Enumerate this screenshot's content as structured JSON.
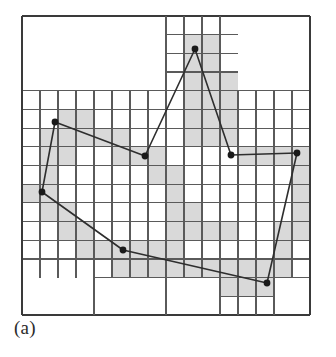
{
  "figure": {
    "caption": "(a)",
    "kind": "quadtree-polygon-decomposition"
  },
  "colors": {
    "background": "#ffffff",
    "grid_line": "#5a5a5a",
    "border_line": "#3a3a3a",
    "shaded_cell": "#d9d9d9",
    "polygon_line": "#2e2e2e",
    "vertex_fill": "#1a1a1a",
    "caption_text": "#2b2b2b"
  },
  "chart_data": {
    "type": "diagram",
    "xlabel": "",
    "ylabel": "",
    "grid": true,
    "legend": "none",
    "canvas": {
      "width": 336,
      "height": 357
    },
    "plot_area": {
      "x": 22,
      "y": 16,
      "width": 288,
      "height": 299
    },
    "base_grid": {
      "cols": 16,
      "rows": 16,
      "cell_width": 18.0,
      "cell_height": 18.6875
    },
    "polygon": {
      "closed": true,
      "vertex_count": 8,
      "vertices": [
        {
          "id": "v1",
          "x": 195,
          "y": 49
        },
        {
          "id": "v2",
          "x": 231,
          "y": 155
        },
        {
          "id": "v3",
          "x": 297,
          "y": 153
        },
        {
          "id": "v4",
          "x": 267,
          "y": 283
        },
        {
          "id": "v5",
          "x": 123,
          "y": 250
        },
        {
          "id": "v6",
          "x": 42,
          "y": 192
        },
        {
          "id": "v7",
          "x": 55,
          "y": 122
        },
        {
          "id": "v8",
          "x": 145,
          "y": 156
        }
      ],
      "edges": [
        {
          "from": "v1",
          "to": "v2"
        },
        {
          "from": "v2",
          "to": "v3"
        },
        {
          "from": "v3",
          "to": "v4"
        },
        {
          "from": "v4",
          "to": "v5"
        },
        {
          "from": "v5",
          "to": "v6"
        },
        {
          "from": "v6",
          "to": "v7"
        },
        {
          "from": "v7",
          "to": "v8"
        },
        {
          "from": "v8",
          "to": "v1"
        }
      ]
    },
    "shaded_cells": [
      {
        "c": 9,
        "r": 1,
        "w": 1,
        "h": 1
      },
      {
        "c": 10,
        "r": 1,
        "w": 1,
        "h": 1
      },
      {
        "c": 9,
        "r": 2,
        "w": 1,
        "h": 1
      },
      {
        "c": 10,
        "r": 2,
        "w": 1,
        "h": 1
      },
      {
        "c": 9,
        "r": 3,
        "w": 1,
        "h": 1
      },
      {
        "c": 10,
        "r": 3,
        "w": 1,
        "h": 1
      },
      {
        "c": 11,
        "r": 3,
        "w": 1,
        "h": 1
      },
      {
        "c": 2,
        "r": 5,
        "w": 1,
        "h": 1
      },
      {
        "c": 3,
        "r": 5,
        "w": 1,
        "h": 1
      },
      {
        "c": 9,
        "r": 4,
        "w": 1,
        "h": 1
      },
      {
        "c": 10,
        "r": 4,
        "w": 1,
        "h": 1
      },
      {
        "c": 11,
        "r": 4,
        "w": 1,
        "h": 1
      },
      {
        "c": 1,
        "r": 6,
        "w": 1,
        "h": 1
      },
      {
        "c": 2,
        "r": 6,
        "w": 1,
        "h": 1
      },
      {
        "c": 3,
        "r": 6,
        "w": 1,
        "h": 1
      },
      {
        "c": 4,
        "r": 6,
        "w": 1,
        "h": 1
      },
      {
        "c": 5,
        "r": 6,
        "w": 1,
        "h": 1
      },
      {
        "c": 9,
        "r": 5,
        "w": 1,
        "h": 1
      },
      {
        "c": 10,
        "r": 5,
        "w": 1,
        "h": 1
      },
      {
        "c": 11,
        "r": 5,
        "w": 1,
        "h": 1
      },
      {
        "c": 1,
        "r": 7,
        "w": 1,
        "h": 1
      },
      {
        "c": 2,
        "r": 7,
        "w": 1,
        "h": 1
      },
      {
        "c": 5,
        "r": 7,
        "w": 1,
        "h": 1
      },
      {
        "c": 6,
        "r": 7,
        "w": 1,
        "h": 1
      },
      {
        "c": 7,
        "r": 7,
        "w": 1,
        "h": 1
      },
      {
        "c": 9,
        "r": 6,
        "w": 1,
        "h": 1
      },
      {
        "c": 10,
        "r": 6,
        "w": 1,
        "h": 1
      },
      {
        "c": 11,
        "r": 6,
        "w": 1,
        "h": 1
      },
      {
        "c": 12,
        "r": 7,
        "w": 1,
        "h": 1
      },
      {
        "c": 13,
        "r": 7,
        "w": 1,
        "h": 1
      },
      {
        "c": 14,
        "r": 7,
        "w": 1,
        "h": 1
      },
      {
        "c": 15,
        "r": 7,
        "w": 1,
        "h": 1
      },
      {
        "c": 1,
        "r": 8,
        "w": 1,
        "h": 1
      },
      {
        "c": 7,
        "r": 8,
        "w": 1,
        "h": 1
      },
      {
        "c": 8,
        "r": 8,
        "w": 1,
        "h": 1
      },
      {
        "c": 15,
        "r": 8,
        "w": 1,
        "h": 1
      },
      {
        "c": 0,
        "r": 9,
        "w": 1,
        "h": 1
      },
      {
        "c": 1,
        "r": 9,
        "w": 1,
        "h": 1
      },
      {
        "c": 8,
        "r": 9,
        "w": 1,
        "h": 1
      },
      {
        "c": 15,
        "r": 9,
        "w": 1,
        "h": 1
      },
      {
        "c": 1,
        "r": 10,
        "w": 1,
        "h": 1
      },
      {
        "c": 2,
        "r": 10,
        "w": 1,
        "h": 1
      },
      {
        "c": 8,
        "r": 10,
        "w": 1,
        "h": 1
      },
      {
        "c": 9,
        "r": 10,
        "w": 1,
        "h": 1
      },
      {
        "c": 15,
        "r": 10,
        "w": 1,
        "h": 1
      },
      {
        "c": 2,
        "r": 11,
        "w": 1,
        "h": 1
      },
      {
        "c": 3,
        "r": 11,
        "w": 1,
        "h": 1
      },
      {
        "c": 8,
        "r": 11,
        "w": 1,
        "h": 1
      },
      {
        "c": 9,
        "r": 11,
        "w": 1,
        "h": 1
      },
      {
        "c": 10,
        "r": 11,
        "w": 1,
        "h": 1
      },
      {
        "c": 11,
        "r": 11,
        "w": 1,
        "h": 1
      },
      {
        "c": 14,
        "r": 11,
        "w": 1,
        "h": 1
      },
      {
        "c": 15,
        "r": 11,
        "w": 1,
        "h": 1
      },
      {
        "c": 3,
        "r": 12,
        "w": 1,
        "h": 1
      },
      {
        "c": 4,
        "r": 12,
        "w": 1,
        "h": 1
      },
      {
        "c": 5,
        "r": 12,
        "w": 1,
        "h": 1
      },
      {
        "c": 6,
        "r": 12,
        "w": 1,
        "h": 1
      },
      {
        "c": 7,
        "r": 12,
        "w": 1,
        "h": 1
      },
      {
        "c": 8,
        "r": 12,
        "w": 1,
        "h": 1
      },
      {
        "c": 14,
        "r": 12,
        "w": 1,
        "h": 1
      },
      {
        "c": 5,
        "r": 13,
        "w": 1,
        "h": 1
      },
      {
        "c": 6,
        "r": 13,
        "w": 1,
        "h": 1
      },
      {
        "c": 7,
        "r": 13,
        "w": 1,
        "h": 1
      },
      {
        "c": 8,
        "r": 13,
        "w": 1,
        "h": 1
      },
      {
        "c": 9,
        "r": 13,
        "w": 1,
        "h": 1
      },
      {
        "c": 10,
        "r": 13,
        "w": 1,
        "h": 1
      },
      {
        "c": 11,
        "r": 13,
        "w": 1,
        "h": 1
      },
      {
        "c": 12,
        "r": 13,
        "w": 1,
        "h": 1
      },
      {
        "c": 13,
        "r": 13,
        "w": 1,
        "h": 1
      },
      {
        "c": 14,
        "r": 13,
        "w": 1,
        "h": 1
      },
      {
        "c": 11,
        "r": 14,
        "w": 1,
        "h": 1
      },
      {
        "c": 12,
        "r": 14,
        "w": 1,
        "h": 1
      },
      {
        "c": 13,
        "r": 14,
        "w": 1,
        "h": 1
      }
    ],
    "grid_lines": {
      "description": "Quadtree subdivision edges, drawn as axis-aligned segments over the 16x16 base lattice",
      "horizontal": [
        {
          "row": 0,
          "from_col": 0,
          "to_col": 16
        },
        {
          "row": 4,
          "from_col": 8,
          "to_col": 9
        },
        {
          "row": 1,
          "from_col": 8,
          "to_col": 12
        },
        {
          "row": 2,
          "from_col": 8,
          "to_col": 12
        },
        {
          "row": 3,
          "from_col": 8,
          "to_col": 12
        },
        {
          "row": 4,
          "from_col": 0,
          "to_col": 16
        },
        {
          "row": 5,
          "from_col": 0,
          "to_col": 8
        },
        {
          "row": 5,
          "from_col": 8,
          "to_col": 16
        },
        {
          "row": 6,
          "from_col": 0,
          "to_col": 16
        },
        {
          "row": 7,
          "from_col": 0,
          "to_col": 16
        },
        {
          "row": 8,
          "from_col": 0,
          "to_col": 16
        },
        {
          "row": 9,
          "from_col": 0,
          "to_col": 16
        },
        {
          "row": 10,
          "from_col": 0,
          "to_col": 16
        },
        {
          "row": 11,
          "from_col": 0,
          "to_col": 16
        },
        {
          "row": 12,
          "from_col": 0,
          "to_col": 16
        },
        {
          "row": 13,
          "from_col": 0,
          "to_col": 16
        },
        {
          "row": 14,
          "from_col": 4,
          "to_col": 16
        },
        {
          "row": 15,
          "from_col": 11,
          "to_col": 14
        },
        {
          "row": 16,
          "from_col": 0,
          "to_col": 16
        }
      ],
      "vertical": [
        {
          "col": 0,
          "from_row": 0,
          "to_row": 16
        },
        {
          "col": 1,
          "from_row": 4,
          "to_row": 14
        },
        {
          "col": 2,
          "from_row": 4,
          "to_row": 14
        },
        {
          "col": 3,
          "from_row": 4,
          "to_row": 14
        },
        {
          "col": 4,
          "from_row": 4,
          "to_row": 16
        },
        {
          "col": 5,
          "from_row": 4,
          "to_row": 14
        },
        {
          "col": 6,
          "from_row": 4,
          "to_row": 14
        },
        {
          "col": 7,
          "from_row": 4,
          "to_row": 14
        },
        {
          "col": 8,
          "from_row": 0,
          "to_row": 16
        },
        {
          "col": 9,
          "from_row": 0,
          "to_row": 14
        },
        {
          "col": 10,
          "from_row": 0,
          "to_row": 14
        },
        {
          "col": 11,
          "from_row": 0,
          "to_row": 16
        },
        {
          "col": 12,
          "from_row": 4,
          "to_row": 16
        },
        {
          "col": 13,
          "from_row": 4,
          "to_row": 16
        },
        {
          "col": 14,
          "from_row": 4,
          "to_row": 16
        },
        {
          "col": 15,
          "from_row": 4,
          "to_row": 14
        },
        {
          "col": 16,
          "from_row": 0,
          "to_row": 16
        }
      ]
    }
  }
}
